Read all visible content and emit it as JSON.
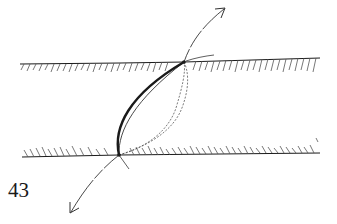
{
  "figure": {
    "label": "43",
    "type": "hand-drawn sketch"
  },
  "colors": {
    "background": "#ffffff",
    "ink": "#1a1a1a",
    "hatch": "#555555"
  },
  "elements": {
    "top_boundary": {
      "x1": 20,
      "y1": 64,
      "x2": 320,
      "y2": 58,
      "hatch_side": "below",
      "hatch_direction": "/"
    },
    "bottom_boundary": {
      "x1": 22,
      "y1": 157,
      "x2": 320,
      "y2": 153,
      "hatch_side": "above",
      "hatch_direction": "\\"
    },
    "top_node": {
      "x": 184,
      "y": 62
    },
    "bottom_node": {
      "x": 119,
      "y": 155
    },
    "arrow_up_end": {
      "x": 225,
      "y": 8
    },
    "arrow_down_end": {
      "x": 70,
      "y": 214
    }
  }
}
